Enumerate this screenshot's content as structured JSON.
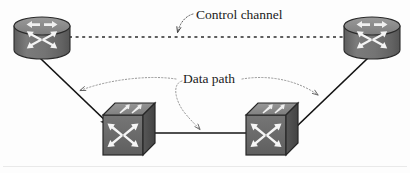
{
  "figure": {
    "background_color": "#fdfdfd",
    "width": 410,
    "height": 173
  },
  "labels": {
    "control_channel": "Control channel",
    "data_path": "Data path"
  },
  "nodes": [
    {
      "id": "router-left",
      "type": "router",
      "shape": "cylinder",
      "label": "",
      "x": 14,
      "y": 17,
      "width": 56,
      "height": 42,
      "body_color": "#6f6f6f",
      "top_color": "#8e8e8e",
      "edge_color": "#2a2a2a",
      "arrow_color": "#f2f2f2"
    },
    {
      "id": "router-right",
      "type": "router",
      "shape": "cylinder",
      "label": "",
      "x": 344,
      "y": 17,
      "width": 56,
      "height": 42,
      "body_color": "#6f6f6f",
      "top_color": "#8e8e8e",
      "edge_color": "#2a2a2a",
      "arrow_color": "#f2f2f2"
    },
    {
      "id": "switch-left",
      "type": "switch",
      "shape": "cube",
      "label": "",
      "x": 103,
      "y": 103,
      "width": 52,
      "height": 52,
      "front_color": "#6b6b6b",
      "top_color": "#8c8c8c",
      "side_color": "#4d4d4d",
      "edge_color": "#2a2a2a",
      "arrow_color": "#f4f4f4"
    },
    {
      "id": "switch-right",
      "type": "switch",
      "shape": "cube",
      "label": "",
      "x": 246,
      "y": 103,
      "width": 52,
      "height": 52,
      "front_color": "#6b6b6b",
      "top_color": "#8c8c8c",
      "side_color": "#4d4d4d",
      "edge_color": "#2a2a2a",
      "arrow_color": "#f4f4f4"
    }
  ],
  "links": [
    {
      "id": "control-channel-link",
      "style": "dashed",
      "from": "router-left",
      "to": "router-right",
      "color": "#2b2b2b",
      "dash": "3,3.5",
      "width": 1.6
    },
    {
      "id": "router-left-to-switch-left",
      "style": "solid",
      "from": "router-left",
      "to": "switch-left",
      "color": "#141414",
      "width": 1.7
    },
    {
      "id": "switch-left-to-switch-right",
      "style": "solid",
      "from": "switch-left",
      "to": "switch-right",
      "color": "#141414",
      "width": 1.7
    },
    {
      "id": "switch-right-to-router-right",
      "style": "solid",
      "from": "switch-right",
      "to": "router-right",
      "color": "#141414",
      "width": 1.7
    }
  ],
  "annotations": [
    {
      "id": "control-channel-leader",
      "label_ref": "control_channel",
      "style": "dotted-arrow",
      "color": "#4a4a4a",
      "target": "control-channel-link"
    },
    {
      "id": "data-path-leader-left",
      "label_ref": "data_path",
      "style": "dotted-arrow",
      "color": "#777777",
      "target": "router-left-to-switch-left"
    },
    {
      "id": "data-path-leader-center",
      "label_ref": "data_path",
      "style": "dotted-arrow",
      "color": "#777777",
      "target": "switch-left-to-switch-right"
    },
    {
      "id": "data-path-leader-right",
      "label_ref": "data_path",
      "style": "dotted-arrow",
      "color": "#777777",
      "target": "switch-right-to-router-right"
    }
  ],
  "footer_rule": {
    "visible": true,
    "color": "#e6e6e6"
  }
}
